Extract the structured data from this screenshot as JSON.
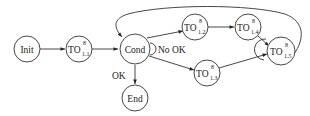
{
  "diagram": {
    "type": "state-flow",
    "nodes": [
      {
        "id": "init",
        "label": "Init",
        "base": "",
        "sup": "",
        "sub": ""
      },
      {
        "id": "to11",
        "label": "TO 8 1.1",
        "base": "TO",
        "sup": "8",
        "sub": "1.1"
      },
      {
        "id": "cond",
        "label": "Cond",
        "base": "",
        "sup": "",
        "sub": ""
      },
      {
        "id": "end",
        "label": "End",
        "base": "",
        "sup": "",
        "sub": ""
      },
      {
        "id": "to12",
        "label": "TO 8 1.2",
        "base": "TO",
        "sup": "8",
        "sub": "1.2"
      },
      {
        "id": "to13",
        "label": "TO 8 1.3",
        "base": "TO",
        "sup": "8",
        "sub": "1.3"
      },
      {
        "id": "to14",
        "label": "TO 8 1.4",
        "base": "TO",
        "sup": "8",
        "sub": "1.4"
      },
      {
        "id": "to15",
        "label": "TO 8 1.5",
        "base": "TO",
        "sup": "8",
        "sub": "1.5"
      }
    ],
    "edges": [
      {
        "from": "init",
        "to": "to11",
        "label": ""
      },
      {
        "from": "to11",
        "to": "cond",
        "label": ""
      },
      {
        "from": "cond",
        "to": "end",
        "label": "OK"
      },
      {
        "from": "cond",
        "to": "to12",
        "label": "No OK"
      },
      {
        "from": "cond",
        "to": "to13",
        "label": ""
      },
      {
        "from": "to12",
        "to": "to14",
        "label": ""
      },
      {
        "from": "to14",
        "to": "to15",
        "label": ""
      },
      {
        "from": "to13",
        "to": "to15",
        "label": ""
      },
      {
        "from": "to15",
        "to": "cond",
        "label": ""
      }
    ],
    "edge_labels": {
      "ok": "OK",
      "no_ok": "No OK"
    },
    "colors": {
      "stroke": "#333333",
      "text": "#222222",
      "background": "#ffffff"
    }
  }
}
